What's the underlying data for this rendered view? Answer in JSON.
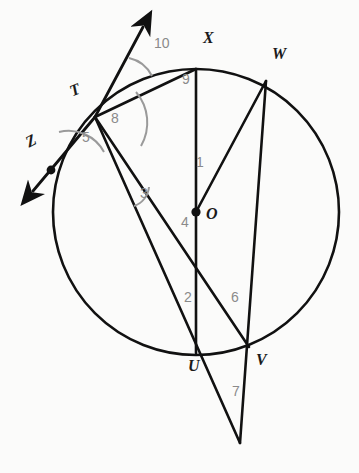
{
  "figure": {
    "background_color": "#fbfbfa",
    "stroke_color": "#111111",
    "label_color": "#1a1a1a",
    "angle_label_color": "#8a8a8a",
    "angle_arc_color": "#9a9a9a"
  },
  "circle": {
    "center_label": "O",
    "cx": 196,
    "cy": 212,
    "r": 143
  },
  "points": [
    {
      "id": "X",
      "label": "X",
      "x": 196,
      "y": 69,
      "label_x": 203,
      "label_y": 36
    },
    {
      "id": "W",
      "label": "W",
      "x": 266,
      "y": 81,
      "label_x": 272,
      "label_y": 52
    },
    {
      "id": "T",
      "label": "T",
      "x": 95,
      "y": 117,
      "label_x": 70,
      "label_y": 88
    },
    {
      "id": "Z",
      "label": "Z",
      "x": 51,
      "y": 170,
      "label_x": 26,
      "label_y": 139
    },
    {
      "id": "O",
      "label": "O",
      "x": 196,
      "y": 212,
      "label_x": 206,
      "label_y": 206
    },
    {
      "id": "U",
      "label": "U",
      "x": 196,
      "y": 353,
      "label_x": 188,
      "label_y": 358
    },
    {
      "id": "V",
      "label": "V",
      "x": 248,
      "y": 346,
      "label_x": 256,
      "label_y": 352
    }
  ],
  "angles": [
    {
      "number": "1",
      "label_x": 196,
      "label_y": 161
    },
    {
      "number": "2",
      "label_x": 184,
      "label_y": 296
    },
    {
      "number": "3",
      "label_x": 140,
      "label_y": 192
    },
    {
      "number": "4",
      "label_x": 181,
      "label_y": 220
    },
    {
      "number": "5",
      "label_x": 82,
      "label_y": 136
    },
    {
      "number": "6",
      "label_x": 231,
      "label_y": 296
    },
    {
      "number": "7",
      "label_x": 232,
      "label_y": 390
    },
    {
      "number": "8",
      "label_x": 111,
      "label_y": 117
    },
    {
      "number": "9",
      "label_x": 182,
      "label_y": 78
    },
    {
      "number": "10",
      "label_x": 156,
      "label_y": 42
    }
  ],
  "segments": [
    {
      "name": "tangent-line-through-T",
      "from": "arrow-up-right",
      "to": "arrow-down-left"
    },
    {
      "name": "chord-T-X",
      "from": "T",
      "to": "X"
    },
    {
      "name": "chord-X-U-diameter",
      "from": "X",
      "to": "U"
    },
    {
      "name": "chord-T-to-apex-through-V",
      "from": "T",
      "to": "apex"
    },
    {
      "name": "chord-T-to-apex-through-U",
      "from": "T",
      "to": "apex2"
    },
    {
      "name": "radius-O-W",
      "from": "O",
      "to": "W"
    },
    {
      "name": "chord-W-V-extended",
      "from": "W",
      "to": "apex"
    },
    {
      "name": "circle-outline",
      "from": "O",
      "to": "r"
    }
  ],
  "markers": {
    "tangent_arrow_up": {
      "x": 139,
      "y": 31
    },
    "tangent_arrow_down": {
      "x": 29,
      "y": 196
    },
    "tangent_point_z_dot": {
      "x": 51,
      "y": 170
    },
    "center_dot": {
      "x": 196,
      "y": 212
    },
    "bottom_apex": {
      "x": 240,
      "y": 443
    }
  }
}
